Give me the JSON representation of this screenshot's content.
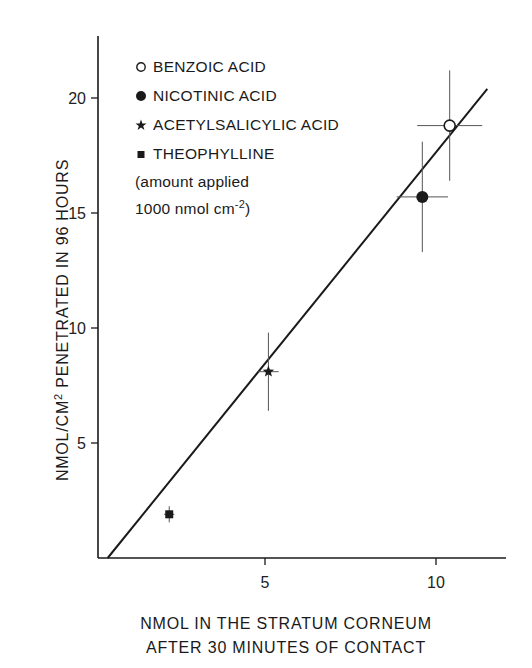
{
  "chart_data": {
    "type": "scatter",
    "title": "",
    "xlabel_lines": [
      "NMOL IN THE STRATUM CORNEUM",
      "AFTER 30 MINUTES OF CONTACT"
    ],
    "ylabel_main": "NMOL/CM",
    "ylabel_sup": "2",
    "ylabel_rest": " PENETRATED IN 96 HOURS",
    "xlim": [
      0,
      12
    ],
    "ylim": [
      0,
      23
    ],
    "xticks": [
      5,
      10
    ],
    "yticks": [
      5,
      10,
      15,
      20
    ],
    "grid": false,
    "legend_position": "upper-left",
    "series": [
      {
        "name": "BENZOIC ACID",
        "marker": "open-circle",
        "x": 10.4,
        "y": 18.8,
        "xerr": 0.95,
        "yerr": 2.4
      },
      {
        "name": "NICOTINIC ACID",
        "marker": "filled-circle",
        "x": 9.6,
        "y": 15.7,
        "xerr": 0.75,
        "yerr": 2.4
      },
      {
        "name": "ACETYLSALICYLIC ACID",
        "marker": "star",
        "x": 5.1,
        "y": 8.1,
        "xerr": 0.3,
        "yerr": 1.7
      },
      {
        "name": "THEOPHYLLINE",
        "marker": "filled-square",
        "x": 2.2,
        "y": 1.9,
        "xerr": 0.15,
        "yerr": 0.35
      }
    ],
    "regression_line": {
      "x": [
        0.4,
        11.5
      ],
      "y": [
        0.0,
        20.4
      ]
    },
    "annotation_lines": [
      "(amount applied",
      "1000 nmol cm"
    ],
    "annotation_sup": "-2",
    "annotation_close": ")"
  },
  "legend": {
    "items": [
      {
        "label": "BENZOIC ACID",
        "marker": "open-circle"
      },
      {
        "label": "NICOTINIC ACID",
        "marker": "filled-circle"
      },
      {
        "label": "ACETYLSALICYLIC ACID",
        "marker": "star"
      },
      {
        "label": "THEOPHYLLINE",
        "marker": "filled-square"
      }
    ]
  },
  "colors": {
    "ink": "#1a1a1a",
    "errorbar": "#555555",
    "background": "#ffffff"
  }
}
